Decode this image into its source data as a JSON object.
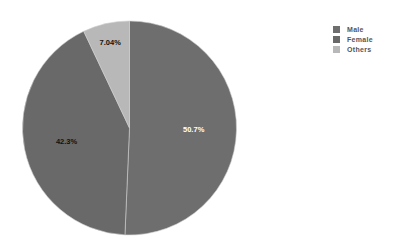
{
  "chart_data": {
    "type": "pie",
    "title": "",
    "categories": [
      "Male",
      "Female",
      "Others"
    ],
    "values": [
      50.7,
      42.3,
      7.04
    ],
    "labels": [
      "50.7%",
      "42.3%",
      "7.04%"
    ],
    "colors": [
      "#6e6e6e",
      "#696969",
      "#b8b8b8"
    ],
    "label_colors": [
      "#ffffff",
      "#111111",
      "#111111"
    ],
    "start_angle_deg": 0,
    "direction": "clockwise",
    "legend_position": "top-right"
  },
  "legend": {
    "items": [
      {
        "label": "Male",
        "color": "#6e6e6e"
      },
      {
        "label": "Female",
        "color": "#696969"
      },
      {
        "label": "Others",
        "color": "#b8b8b8"
      }
    ]
  }
}
